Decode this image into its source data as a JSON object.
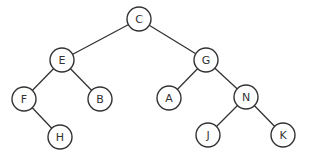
{
  "diagram": {
    "type": "binary-tree",
    "root": "C",
    "nodes": [
      {
        "id": "C",
        "label": "C",
        "x": 139,
        "y": 19
      },
      {
        "id": "E",
        "label": "E",
        "x": 62,
        "y": 60
      },
      {
        "id": "G",
        "label": "G",
        "x": 206,
        "y": 60
      },
      {
        "id": "F",
        "label": "F",
        "x": 24,
        "y": 99
      },
      {
        "id": "B",
        "label": "B",
        "x": 100,
        "y": 99
      },
      {
        "id": "A",
        "label": "A",
        "x": 169,
        "y": 98
      },
      {
        "id": "N",
        "label": "N",
        "x": 246,
        "y": 97
      },
      {
        "id": "H",
        "label": "H",
        "x": 60,
        "y": 137
      },
      {
        "id": "J",
        "label": "J",
        "x": 208,
        "y": 135
      },
      {
        "id": "K",
        "label": "K",
        "x": 283,
        "y": 135
      }
    ],
    "edges": [
      [
        "C",
        "E"
      ],
      [
        "C",
        "G"
      ],
      [
        "E",
        "F"
      ],
      [
        "E",
        "B"
      ],
      [
        "G",
        "A"
      ],
      [
        "G",
        "N"
      ],
      [
        "F",
        "H"
      ],
      [
        "N",
        "J"
      ],
      [
        "N",
        "K"
      ]
    ],
    "node_radius": 12
  }
}
